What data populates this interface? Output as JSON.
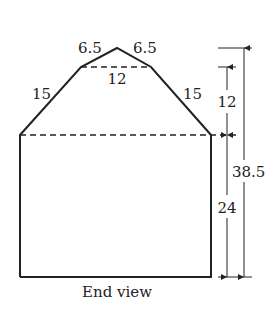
{
  "diagram": {
    "caption": "End view",
    "labels": {
      "roof_upper_left": "6.5",
      "roof_upper_right": "6.5",
      "roof_top_width": "12",
      "roof_lower_left": "15",
      "roof_lower_right": "15",
      "dim_roof_height": "12",
      "dim_wall_height": "24",
      "dim_total_height": "38.5"
    },
    "colors": {
      "stroke": "#222222",
      "background": "#ffffff"
    }
  }
}
